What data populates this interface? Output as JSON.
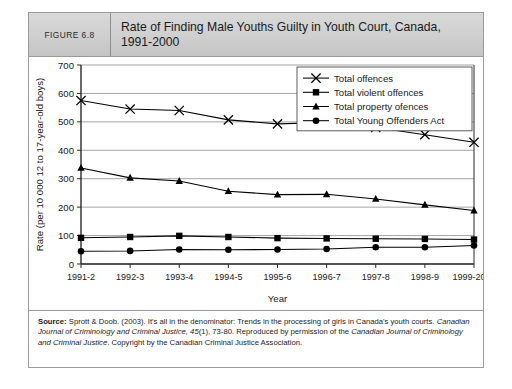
{
  "figure": {
    "number_label": "FIGURE 6.8",
    "title": "Rate of Finding Male Youths Guilty in Youth Court, Canada, 1991-2000"
  },
  "source": {
    "label": "Source:",
    "text_part1": " Sprott & Doob. (2003). It's all in the denominator: Trends in the processing of girls in Canada's youth courts. ",
    "journal1": "Canadian Journal of Criminology and Criminal Justice,",
    "volume": " 45",
    "text_part2": "(1), 73-80. Reproduced by permission of the ",
    "journal2": "Canadian Journal of Criminology and Criminal Justice",
    "text_part3": ". Copyright by the Canadian Criminal Justice Association."
  },
  "chart_data": {
    "type": "line",
    "title": "",
    "xlabel": "Year",
    "ylabel": "Rate (per 10 000 12 to 17-year-old boys)",
    "categories": [
      "1991-2",
      "1992-3",
      "1993-4",
      "1994-5",
      "1995-6",
      "1996-7",
      "1997-8",
      "1998-9",
      "1999-2000"
    ],
    "ylim": [
      0,
      700
    ],
    "yticks": [
      0,
      100,
      200,
      300,
      400,
      500,
      600,
      700
    ],
    "grid": true,
    "legend_position": "top-right",
    "series": [
      {
        "name": "Total offences",
        "marker": "x",
        "color": "#000000",
        "values": [
          575,
          545,
          540,
          507,
          493,
          498,
          480,
          455,
          428
        ]
      },
      {
        "name": "Total violent offences",
        "marker": "square",
        "color": "#000000",
        "values": [
          92,
          95,
          99,
          95,
          91,
          90,
          89,
          88,
          86
        ]
      },
      {
        "name": "Total property ofences",
        "marker": "triangle",
        "color": "#000000",
        "values": [
          338,
          303,
          292,
          256,
          244,
          245,
          229,
          208,
          188
        ]
      },
      {
        "name": "Total Young Offenders Act",
        "marker": "circle",
        "color": "#000000",
        "values": [
          45,
          46,
          51,
          50,
          51,
          53,
          59,
          59,
          65
        ]
      }
    ]
  }
}
